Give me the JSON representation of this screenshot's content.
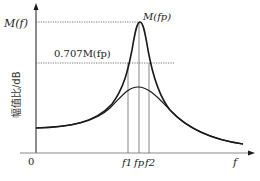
{
  "diagram": {
    "y_axis_label": "幅值比/dB",
    "y_axis_symbol": "M(f)",
    "x_axis_symbol": "f",
    "origin_label": "0",
    "peak_label": "M(fp)",
    "half_power_label": "0.707M(fp)",
    "freq_marks": {
      "f1": "f1",
      "fp": "fp",
      "f2": "f2"
    },
    "curves": [
      {
        "name": "high-Q response (sharp peak)",
        "peak_y_px": 22
      },
      {
        "name": "low-Q response (broad peak)",
        "peak_y_px": 87
      }
    ],
    "colors": {
      "curve": "#1a1a1a",
      "axis": "#1a1a1a",
      "dotted": "#555555",
      "guides": "#444444"
    }
  }
}
